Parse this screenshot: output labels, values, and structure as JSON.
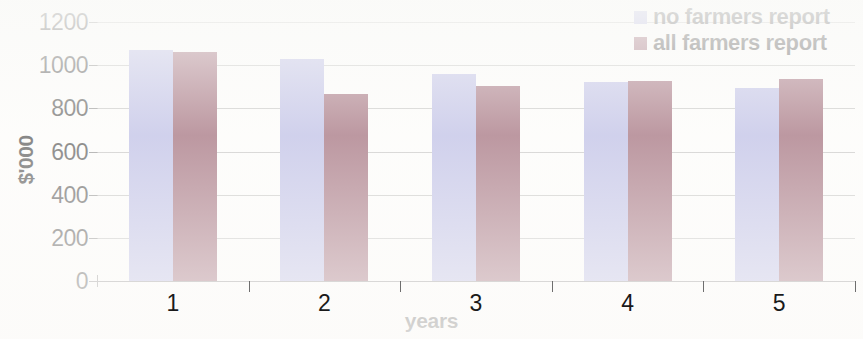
{
  "chart_data": {
    "type": "bar",
    "title": "",
    "xlabel": "years",
    "ylabel": "$'000",
    "categories": [
      "1",
      "2",
      "3",
      "4",
      "5"
    ],
    "series": [
      {
        "name": "no farmers report",
        "color": "#a3a5de",
        "values": [
          1070,
          1030,
          960,
          920,
          895
        ]
      },
      {
        "name": "all farmers report",
        "color": "#7b3347",
        "values": [
          1060,
          865,
          905,
          925,
          935
        ]
      }
    ],
    "ylim": [
      0,
      1200
    ],
    "ytick_labels": [
      "1200",
      "1000",
      "800",
      "600",
      "400",
      "200",
      "0"
    ],
    "ytick_values": [
      1200,
      1000,
      800,
      600,
      400,
      200,
      0
    ],
    "grid": true,
    "legend_position": "top-right"
  },
  "legend": {
    "items": [
      {
        "label": "no farmers report",
        "swatch": "legend-swatch-blue"
      },
      {
        "label": "all farmers report",
        "swatch": "legend-swatch-maroon"
      }
    ]
  },
  "axes": {
    "y_title": "$'000",
    "x_title": "years"
  }
}
